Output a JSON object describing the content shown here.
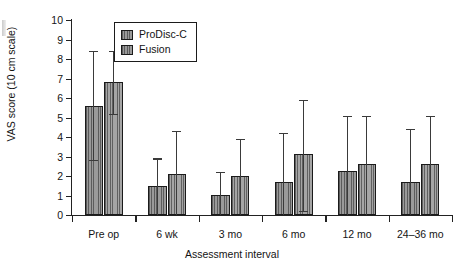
{
  "chart_data": {
    "type": "bar",
    "title": "",
    "xlabel": "Assessment interval",
    "ylabel": "VAS score (10 cm scale)",
    "ylim": [
      0,
      10
    ],
    "ytick_labels": [
      "0",
      "1",
      "2",
      "3",
      "4",
      "5",
      "6",
      "7",
      "8",
      "9",
      "10"
    ],
    "yticks": [
      0,
      1,
      2,
      3,
      4,
      5,
      6,
      7,
      8,
      9,
      10
    ],
    "grid": false,
    "legend_position": "top-left-inside",
    "categories": [
      "Pre op",
      "6 wk",
      "3 mo",
      "6 mo",
      "12 mo",
      "24–36 mo"
    ],
    "series": [
      {
        "name": "ProDisc-C",
        "color": "#9a9a9a",
        "values": [
          5.6,
          1.5,
          1.05,
          1.7,
          2.25,
          1.7
        ],
        "error_low": [
          2.8,
          0.0,
          0.0,
          0.0,
          0.0,
          0.0
        ],
        "error_high": [
          8.4,
          2.9,
          2.2,
          4.2,
          5.1,
          4.4
        ]
      },
      {
        "name": "Fusion",
        "color": "#a5a5a5",
        "values": [
          6.8,
          2.1,
          2.0,
          3.15,
          2.6,
          2.6
        ],
        "error_low": [
          5.2,
          0.0,
          0.0,
          0.2,
          0.0,
          0.0
        ],
        "error_high": [
          8.4,
          4.3,
          3.9,
          5.9,
          5.1,
          5.1
        ]
      }
    ]
  },
  "legend": {
    "items": [
      {
        "label": "ProDisc-C"
      },
      {
        "label": "Fusion"
      }
    ]
  }
}
